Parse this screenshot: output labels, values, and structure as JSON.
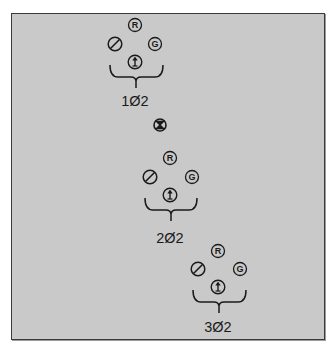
{
  "diagram": {
    "groups": [
      {
        "id": "group-1",
        "label": "1Ø2",
        "pins": [
          {
            "type": "R",
            "glyph": "R"
          },
          {
            "type": "slash",
            "glyph": "Ø"
          },
          {
            "type": "G",
            "glyph": "G"
          },
          {
            "type": "arrow",
            "glyph": "↑"
          }
        ]
      },
      {
        "id": "group-2",
        "label": "2Ø2",
        "pins": [
          {
            "type": "R",
            "glyph": "R"
          },
          {
            "type": "slash",
            "glyph": "Ø"
          },
          {
            "type": "G",
            "glyph": "G"
          },
          {
            "type": "arrow",
            "glyph": "↑"
          }
        ]
      },
      {
        "id": "group-3",
        "label": "3Ø2",
        "pins": [
          {
            "type": "R",
            "glyph": "R"
          },
          {
            "type": "slash",
            "glyph": "Ø"
          },
          {
            "type": "G",
            "glyph": "G"
          },
          {
            "type": "arrow",
            "glyph": "↑"
          }
        ]
      }
    ],
    "separator": {
      "symbol": "crossed-circle"
    },
    "pin_letters": {
      "R": "R",
      "G": "G"
    },
    "colors": {
      "background": "#c9c9c9",
      "stroke": "#1a1a1a",
      "frame_border": "#3a3a3a"
    }
  }
}
